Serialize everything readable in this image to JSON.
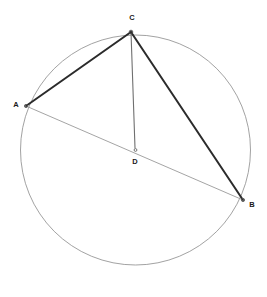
{
  "diagram": {
    "type": "euclidean-geometry",
    "canvas": {
      "width": 267,
      "height": 297
    },
    "background_color": "#ffffff",
    "circle": {
      "name": "main-circle",
      "center_label": "D",
      "cx": 135.5,
      "cy": 150,
      "r": 115,
      "stroke_color": "#8a8a8a",
      "stroke_width": 0.8,
      "fill": "none"
    },
    "points": [
      {
        "id": "A",
        "label": "A",
        "x": 26,
        "y": 106,
        "label_x": 16,
        "label_y": 105,
        "on_circle": true,
        "marker_r": 1.6,
        "marker_color": "#555555"
      },
      {
        "id": "B",
        "label": "B",
        "x": 243,
        "y": 200,
        "label_x": 252,
        "label_y": 205,
        "on_circle": true,
        "marker_r": 1.6,
        "marker_color": "#555555"
      },
      {
        "id": "C",
        "label": "C",
        "x": 131,
        "y": 32,
        "label_x": 132,
        "label_y": 18,
        "on_circle": true,
        "marker_r": 1.8,
        "marker_color": "#444444"
      },
      {
        "id": "D",
        "label": "D",
        "x": 135.5,
        "y": 150,
        "label_x": 135,
        "label_y": 162,
        "on_circle": false,
        "marker_r": 1.4,
        "marker_color": "#666666"
      }
    ],
    "segments": [
      {
        "id": "CA",
        "name": "segment-c-a",
        "from": "C",
        "to": "A",
        "x1": 131,
        "y1": 32,
        "x2": 26,
        "y2": 106,
        "stroke_color": "#2b2b2b",
        "stroke_width": 2.0,
        "style": "solid"
      },
      {
        "id": "CB",
        "name": "segment-c-b",
        "from": "C",
        "to": "B",
        "x1": 131,
        "y1": 32,
        "x2": 243,
        "y2": 200,
        "stroke_color": "#2b2b2b",
        "stroke_width": 2.0,
        "style": "solid"
      },
      {
        "id": "CD",
        "name": "segment-c-d",
        "from": "C",
        "to": "D",
        "x1": 131,
        "y1": 32,
        "x2": 135,
        "y2": 148,
        "stroke_color": "#6f6f6f",
        "stroke_width": 1.1,
        "style": "solid"
      },
      {
        "id": "AB",
        "name": "segment-a-b",
        "from": "A",
        "to": "B",
        "x1": 26,
        "y1": 106,
        "x2": 243,
        "y2": 200,
        "stroke_color": "#9a9a9a",
        "stroke_width": 0.9,
        "style": "solid"
      }
    ]
  }
}
